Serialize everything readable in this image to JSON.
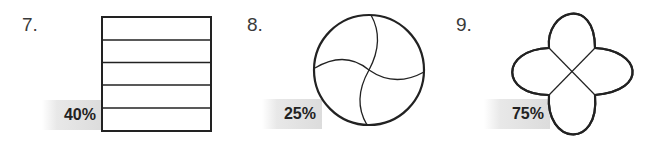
{
  "problems": [
    {
      "number": "7.",
      "percent": "40%",
      "shape": "rectangle-5-strips"
    },
    {
      "number": "8.",
      "percent": "25%",
      "shape": "circle-4-curved-parts"
    },
    {
      "number": "9.",
      "percent": "75%",
      "shape": "four-petal-flower"
    }
  ],
  "colors": {
    "stroke": "#222222",
    "label_bg": "#dcdcdc",
    "text": "#222222"
  }
}
